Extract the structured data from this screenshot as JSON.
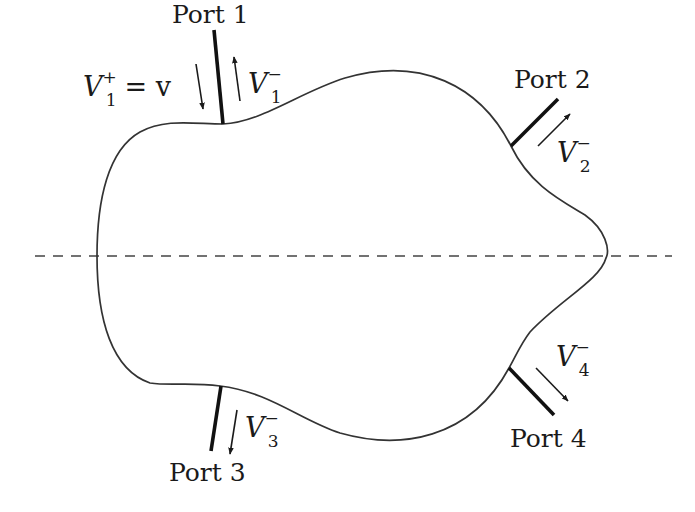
{
  "diagram": {
    "axis": {
      "style": "dashed",
      "orientation": "horizontal"
    },
    "ports": [
      {
        "id": 1,
        "label": "Port 1",
        "wave_var": "V",
        "subscript": "1",
        "superscript": "−",
        "incident": {
          "var": "V",
          "subscript": "1",
          "superscript": "+",
          "equals": "= v"
        }
      },
      {
        "id": 2,
        "label": "Port 2",
        "wave_var": "V",
        "subscript": "2",
        "superscript": "−"
      },
      {
        "id": 3,
        "label": "Port 3",
        "wave_var": "V",
        "subscript": "3",
        "superscript": "−"
      },
      {
        "id": 4,
        "label": "Port 4",
        "wave_var": "V",
        "subscript": "4",
        "superscript": "−"
      }
    ],
    "colors": {
      "stroke": "#1a1a1a",
      "outline": "#333333",
      "background": "#ffffff"
    }
  }
}
